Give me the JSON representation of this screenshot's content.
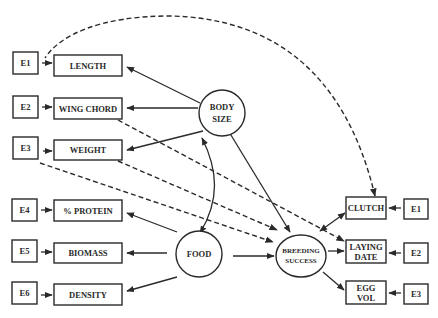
{
  "diagram": {
    "type": "path-diagram",
    "colors": {
      "ink": "#2a2a2a",
      "background": "#ffffff"
    },
    "latent_nodes": [
      {
        "id": "body_size",
        "lines": [
          "BODY",
          "SIZE"
        ]
      },
      {
        "id": "food",
        "lines": [
          "FOOD"
        ]
      },
      {
        "id": "breeding_success",
        "lines": [
          "BREEDING",
          "SUCCESS"
        ]
      }
    ],
    "left_indicators": [
      {
        "id": "length",
        "label": "LENGTH",
        "error": "E1",
        "latent": "body_size"
      },
      {
        "id": "wing_chord",
        "label": "WING CHORD",
        "error": "E2",
        "latent": "body_size"
      },
      {
        "id": "weight",
        "label": "WEIGHT",
        "error": "E3",
        "latent": "body_size"
      },
      {
        "id": "protein",
        "label": "% PROTEIN",
        "error": "E4",
        "latent": "food"
      },
      {
        "id": "biomass",
        "label": "BIOMASS",
        "error": "E5",
        "latent": "food"
      },
      {
        "id": "density",
        "label": "DENSITY",
        "error": "E6",
        "latent": "food"
      }
    ],
    "right_indicators": [
      {
        "id": "clutch",
        "lines": [
          "CLUTCH"
        ],
        "error": "E1",
        "latent": "breeding_success"
      },
      {
        "id": "laying_date",
        "lines": [
          "LAYING",
          "DATE"
        ],
        "error": "E2",
        "latent": "breeding_success"
      },
      {
        "id": "egg_vol",
        "lines": [
          "EGG",
          "VOL"
        ],
        "error": "E3",
        "latent": "breeding_success"
      }
    ],
    "paths": [
      {
        "from": "body_size",
        "to": "breeding_success",
        "style": "solid"
      },
      {
        "from": "food",
        "to": "breeding_success",
        "style": "solid"
      },
      {
        "from": "food",
        "to": "body_size",
        "style": "solid-curved-double"
      },
      {
        "from": "E1-left",
        "to": "clutch",
        "style": "dashed-curved"
      },
      {
        "from": "wing_chord",
        "to": "laying_date",
        "style": "dashed"
      },
      {
        "from": "weight",
        "to": "breeding_success",
        "style": "dashed"
      },
      {
        "from": "E3-left",
        "to": "breeding_success",
        "style": "dashed"
      }
    ]
  }
}
